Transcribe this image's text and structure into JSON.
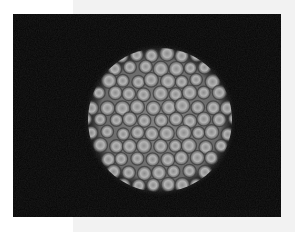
{
  "image": {
    "subject": "electron micrograph of icosahedral virus particle",
    "background_color": "#050505",
    "particle_color": "#9a9a9a",
    "particle_center": [
      147,
      106
    ],
    "particle_radius": 74,
    "capsomere_radius": 7,
    "capsomere_spacing": 15
  },
  "page": {
    "background": "#ffffff",
    "panel_color": "#f2f2f2"
  }
}
